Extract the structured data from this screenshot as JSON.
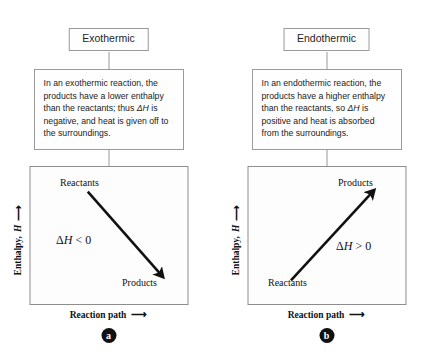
{
  "figure": {
    "kind": "enthalpy-diagram",
    "colors": {
      "line": "#111111",
      "box_border": "#9a9a9a",
      "graph_border": "#8d8d8d",
      "background": "#ffffff",
      "badge": "#111111"
    }
  },
  "panels": [
    {
      "id": "exothermic",
      "title": "Exothermic",
      "description_parts": {
        "before": "In an exothermic reaction, the products have a lower enthalpy than the reactants; thus ",
        "symbol": "ΔH",
        "after": " is negative, and heat is given off to the surroundings."
      },
      "description_full": "In an exothermic reaction, the products have a lower enthalpy than the reactants; thus ΔH is negative, and heat is given off to the surroundings.",
      "graph": {
        "start_label": "Reactants",
        "end_label": "Products",
        "delta_prefix": "Δ",
        "delta_var": "H",
        "delta_relation": " < 0",
        "delta_label": "ΔH < 0",
        "direction": "downhill",
        "y_axis_label": "Enthalpy,",
        "y_axis_var": "H",
        "x_axis_label": "Reaction path",
        "arrow_glyph": "⟶"
      },
      "badge": "a"
    },
    {
      "id": "endothermic",
      "title": "Endothermic",
      "description_parts": {
        "before": "In an endothermic reaction, the products have a higher enthalpy than the reactants, so ",
        "symbol": "ΔH",
        "after": " is positive and heat is absorbed from the surroundings."
      },
      "description_full": "In an endothermic reaction, the products have a higher enthalpy than the reactants, so ΔH is positive and heat is absorbed from the surroundings.",
      "graph": {
        "start_label": "Reactants",
        "end_label": "Products",
        "delta_prefix": "Δ",
        "delta_var": "H",
        "delta_relation": " > 0",
        "delta_label": "ΔH > 0",
        "direction": "uphill",
        "y_axis_label": "Enthalpy,",
        "y_axis_var": "H",
        "x_axis_label": "Reaction path",
        "arrow_glyph": "⟶"
      },
      "badge": "b"
    }
  ]
}
